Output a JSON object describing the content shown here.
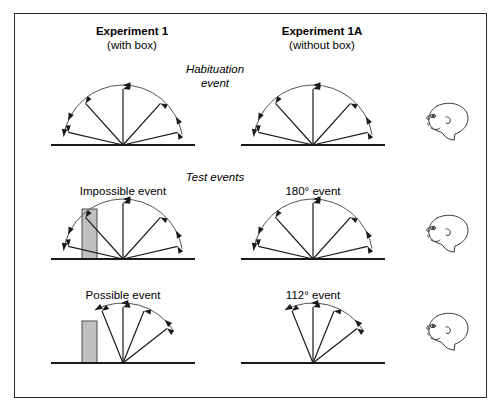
{
  "figure": {
    "border_color": "#2b2b2b",
    "background": "#ffffff",
    "line_color": "#1a1a1a",
    "arc_color": "#555555",
    "box_fill": "#c0c0c0",
    "box_stroke": "#4d4d4d"
  },
  "columns": [
    {
      "id": "experiment-1",
      "main": "Experiment 1",
      "sub": "(with box)"
    },
    {
      "id": "experiment-1a",
      "main": "Experiment 1A",
      "sub": "(without box)"
    }
  ],
  "rows": [
    {
      "id": "habituation",
      "title_line1": "Habituation",
      "title_line2": "event"
    },
    {
      "id": "test",
      "title_line1": "Test events",
      "title_line2": ""
    }
  ],
  "events": {
    "habituation_left": "",
    "habituation_right": "",
    "impossible": "Impossible event",
    "possible": "Possible event",
    "deg180": "180° event",
    "deg112": "112° event"
  },
  "diagrams": {
    "habituation_left": {
      "name": "habituation-event-with-box",
      "sweep_degrees": 180,
      "arm_angles": [
        13,
        48,
        90,
        132,
        167
      ],
      "arc_radius": 60,
      "arc_start_deg": 10,
      "arc_end_deg": 172,
      "has_box": false,
      "rotation": "counterclockwise"
    },
    "habituation_right": {
      "name": "habituation-event-without-box",
      "sweep_degrees": 180,
      "arm_angles": [
        13,
        48,
        90,
        132,
        167
      ],
      "arc_radius": 60,
      "arc_start_deg": 10,
      "arc_end_deg": 172,
      "has_box": false,
      "rotation": "counterclockwise"
    },
    "impossible": {
      "name": "impossible-event",
      "sweep_degrees": 180,
      "arm_angles": [
        13,
        48,
        90,
        132,
        167
      ],
      "arc_radius": 60,
      "arc_start_deg": 10,
      "arc_end_deg": 172,
      "has_box": true,
      "box": {
        "x": -41,
        "width": 15,
        "height": 50
      },
      "rotation": "counterclockwise"
    },
    "possible": {
      "name": "possible-event",
      "sweep_degrees": 112,
      "arm_angles": [
        38,
        68,
        90,
        112
      ],
      "arc_radius": 60,
      "arc_start_deg": 32,
      "arc_end_deg": 118,
      "has_box": true,
      "box": {
        "x": -41,
        "width": 15,
        "height": 42
      },
      "rotation": "counterclockwise"
    },
    "deg180": {
      "name": "180-degree-event",
      "sweep_degrees": 180,
      "arm_angles": [
        13,
        48,
        90,
        132,
        167
      ],
      "arc_radius": 60,
      "arc_start_deg": 10,
      "arc_end_deg": 172,
      "has_box": false,
      "rotation": "counterclockwise"
    },
    "deg112": {
      "name": "112-degree-event",
      "sweep_degrees": 112,
      "arm_angles": [
        38,
        68,
        90,
        112
      ],
      "arc_radius": 60,
      "arc_start_deg": 32,
      "arc_end_deg": 118,
      "has_box": false,
      "rotation": "counterclockwise"
    }
  },
  "infant_observers": [
    {
      "id": "infant-head-habituation",
      "facing": "left"
    },
    {
      "id": "infant-head-test-1",
      "facing": "left"
    },
    {
      "id": "infant-head-test-2",
      "facing": "left"
    }
  ]
}
